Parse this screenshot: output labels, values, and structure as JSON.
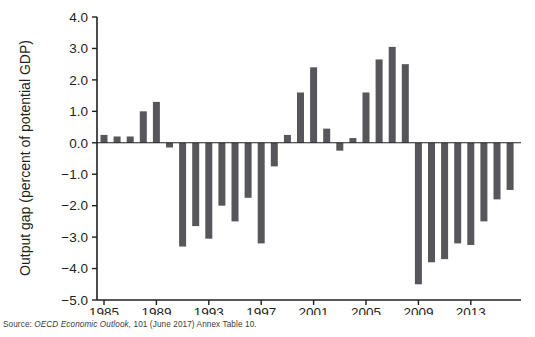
{
  "figure": {
    "source_prefix": "Source:",
    "source_italic": "OECD Economic Outlook,",
    "source_rest": "101 (June 2017) Annex Table 10."
  },
  "chart_data": {
    "type": "bar",
    "title": "",
    "subtitle": "",
    "xlabel": "",
    "ylabel": "Output gap (percent of potential GDP)",
    "ylim": [
      -5.0,
      4.0
    ],
    "ytick_labels": [
      "4.0",
      "3.0",
      "2.0",
      "1.0",
      "0.0",
      "−1.0",
      "−2.0",
      "−3.0",
      "−4.0",
      "−5.0"
    ],
    "ytick_values": [
      4.0,
      3.0,
      2.0,
      1.0,
      0.0,
      -1.0,
      -2.0,
      -3.0,
      -4.0,
      -5.0
    ],
    "xtick_labels": [
      "1985",
      "1989",
      "1993",
      "1997",
      "2001",
      "2005",
      "2009",
      "2013"
    ],
    "xtick_values": [
      1985,
      1989,
      1993,
      1997,
      2001,
      2005,
      2009,
      2013
    ],
    "xlim": [
      1984.2,
      1016.8
    ],
    "grid": false,
    "legend": null,
    "bar_color": "#57565a",
    "categories": [
      "1985",
      "1986",
      "1987",
      "1988",
      "1989",
      "1990",
      "1991",
      "1992",
      "1993",
      "1994",
      "1995",
      "1996",
      "1997",
      "1998",
      "1999",
      "2000",
      "2001",
      "2002",
      "2003",
      "2004",
      "2005",
      "2006",
      "2007",
      "2008",
      "2009",
      "2010",
      "2011",
      "2012",
      "2013",
      "2014",
      "2015",
      "2016"
    ],
    "values": [
      0.25,
      0.2,
      0.2,
      1.0,
      1.3,
      -0.15,
      -3.3,
      -2.65,
      -3.05,
      -2.0,
      -2.5,
      -1.75,
      -3.2,
      -0.75,
      0.25,
      1.6,
      2.4,
      0.45,
      -0.25,
      0.15,
      1.6,
      2.65,
      3.05,
      2.5,
      -4.5,
      -3.8,
      -3.7,
      -3.2,
      -3.25,
      -2.5,
      -1.8,
      -1.5
    ]
  }
}
